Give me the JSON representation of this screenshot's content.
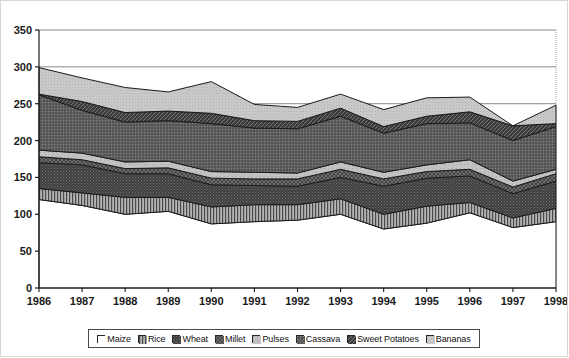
{
  "chart_data": {
    "type": "area",
    "stacked": true,
    "title": "",
    "xlabel": "",
    "ylabel": "",
    "ylim": [
      0,
      350
    ],
    "ytick_step": 50,
    "yticks": [
      0,
      50,
      100,
      150,
      200,
      250,
      300,
      350
    ],
    "grid": "horizontal-major-only",
    "legend_position": "bottom",
    "categories": [
      "1986",
      "1987",
      "1988",
      "1989",
      "1990",
      "1991",
      "1992",
      "1993",
      "1994",
      "1995",
      "1996",
      "1997",
      "1998"
    ],
    "series": [
      {
        "name": "Maize",
        "pattern": "solid-white",
        "color": "#ffffff",
        "values": [
          120,
          112,
          100,
          104,
          87,
          90,
          92,
          100,
          80,
          88,
          102,
          82,
          90
        ]
      },
      {
        "name": "Rice",
        "pattern": "vertical-lines",
        "color": "#8c8c8c",
        "values": [
          15,
          17,
          23,
          19,
          23,
          23,
          21,
          21,
          20,
          23,
          14,
          13,
          18
        ]
      },
      {
        "name": "Wheat",
        "pattern": "dense-dark",
        "color": "#454545",
        "values": [
          35,
          38,
          32,
          32,
          30,
          26,
          25,
          29,
          38,
          38,
          36,
          33,
          37
        ]
      },
      {
        "name": "Millet",
        "pattern": "cross-hatch",
        "color": "#6b6b6b",
        "values": [
          8,
          7,
          7,
          8,
          9,
          9,
          10,
          11,
          10,
          9,
          9,
          9,
          10
        ]
      },
      {
        "name": "Pulses",
        "pattern": "light-solid",
        "color": "#bcbcbc",
        "values": [
          9,
          9,
          9,
          9,
          9,
          9,
          8,
          10,
          9,
          9,
          13,
          8,
          6
        ]
      },
      {
        "name": "Cassava",
        "pattern": "medium-stipple",
        "color": "#595959",
        "values": [
          75,
          58,
          54,
          55,
          65,
          60,
          60,
          62,
          53,
          56,
          50,
          55,
          58
        ]
      },
      {
        "name": "Sweet Potatoes",
        "pattern": "dark-diagonal",
        "color": "#3d3d3d",
        "values": [
          1,
          12,
          13,
          13,
          14,
          10,
          10,
          11,
          9,
          10,
          15,
          20,
          4
        ]
      },
      {
        "name": "Bananas",
        "pattern": "pale-stipple",
        "color": "#cfcfcf",
        "values": [
          36,
          32,
          34,
          26,
          43,
          22,
          19,
          19,
          23,
          25,
          20,
          0,
          25
        ]
      }
    ],
    "cumulative_top": [
      299,
      285,
      272,
      266,
      280,
      249,
      245,
      263,
      242,
      258,
      259,
      220,
      248
    ]
  },
  "legend": {
    "items": [
      {
        "label": "Maize",
        "swatch": "swatch-maize"
      },
      {
        "label": "Rice",
        "swatch": "swatch-rice"
      },
      {
        "label": "Wheat",
        "swatch": "swatch-wheat"
      },
      {
        "label": "Millet",
        "swatch": "swatch-millet"
      },
      {
        "label": "Pulses",
        "swatch": "swatch-pulses"
      },
      {
        "label": "Cassava",
        "swatch": "swatch-cassava"
      },
      {
        "label": "Sweet Potatoes",
        "swatch": "swatch-sweet-potatoes"
      },
      {
        "label": "Bananas",
        "swatch": "swatch-bananas"
      }
    ]
  }
}
